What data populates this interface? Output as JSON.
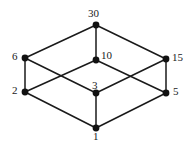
{
  "diagram": {
    "type": "hasse-diagram",
    "background_color": "#ffffff",
    "edge_color": "#1a1a1a",
    "node_color": "#111111",
    "label_color": "#1a1a1a",
    "view_box": "0 0 194 147",
    "nodes": [
      {
        "id": "n30",
        "label": "30",
        "x": 96,
        "y": 25,
        "label_x": 88,
        "label_y": 8,
        "radius": 3.4
      },
      {
        "id": "n6",
        "label": "6",
        "x": 25,
        "y": 58,
        "label_x": 12,
        "label_y": 51,
        "radius": 3.4
      },
      {
        "id": "n10",
        "label": "10",
        "x": 96,
        "y": 60,
        "label_x": 101,
        "label_y": 50,
        "radius": 3.4
      },
      {
        "id": "n15",
        "label": "15",
        "x": 166,
        "y": 59,
        "label_x": 172,
        "label_y": 52,
        "radius": 3.4
      },
      {
        "id": "n2",
        "label": "2",
        "x": 25,
        "y": 92,
        "label_x": 12,
        "label_y": 85,
        "radius": 3.4
      },
      {
        "id": "n3",
        "label": "3",
        "x": 96,
        "y": 93,
        "label_x": 92,
        "label_y": 80,
        "radius": 3.4
      },
      {
        "id": "n5",
        "label": "5",
        "x": 166,
        "y": 93,
        "label_x": 173,
        "label_y": 86,
        "radius": 3.4
      },
      {
        "id": "n1",
        "label": "1",
        "x": 96,
        "y": 128,
        "label_x": 93,
        "label_y": 131,
        "radius": 3.4
      }
    ],
    "edges": [
      {
        "id": "e-30-6",
        "from": "n30",
        "to": "n6",
        "x1": 96,
        "y1": 25,
        "x2": 25,
        "y2": 58
      },
      {
        "id": "e-30-10",
        "from": "n30",
        "to": "n10",
        "x1": 96,
        "y1": 25,
        "x2": 96,
        "y2": 60
      },
      {
        "id": "e-30-15",
        "from": "n30",
        "to": "n15",
        "x1": 96,
        "y1": 25,
        "x2": 166,
        "y2": 59
      },
      {
        "id": "e-6-2",
        "from": "n6",
        "to": "n2",
        "x1": 25,
        "y1": 58,
        "x2": 25,
        "y2": 92
      },
      {
        "id": "e-6-3",
        "from": "n6",
        "to": "n3",
        "x1": 25,
        "y1": 58,
        "x2": 96,
        "y2": 93
      },
      {
        "id": "e-10-2",
        "from": "n10",
        "to": "n2",
        "x1": 96,
        "y1": 60,
        "x2": 25,
        "y2": 92
      },
      {
        "id": "e-10-5",
        "from": "n10",
        "to": "n5",
        "x1": 96,
        "y1": 60,
        "x2": 166,
        "y2": 93
      },
      {
        "id": "e-15-3",
        "from": "n15",
        "to": "n3",
        "x1": 166,
        "y1": 59,
        "x2": 96,
        "y2": 93
      },
      {
        "id": "e-15-5",
        "from": "n15",
        "to": "n5",
        "x1": 166,
        "y1": 59,
        "x2": 166,
        "y2": 93
      },
      {
        "id": "e-2-1",
        "from": "n2",
        "to": "n1",
        "x1": 25,
        "y1": 92,
        "x2": 96,
        "y2": 128
      },
      {
        "id": "e-3-1",
        "from": "n3",
        "to": "n1",
        "x1": 96,
        "y1": 93,
        "x2": 96,
        "y2": 128
      },
      {
        "id": "e-5-1",
        "from": "n5",
        "to": "n1",
        "x1": 166,
        "y1": 93,
        "x2": 96,
        "y2": 128
      }
    ]
  }
}
